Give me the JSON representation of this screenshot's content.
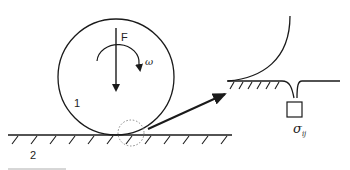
{
  "diagram": {
    "labels": {
      "force": "F",
      "angular_velocity": "ω",
      "body_1": "1",
      "body_2": "2",
      "stress": "σ",
      "stress_subscript": "ij"
    },
    "colors": {
      "stroke": "#1a1a1a",
      "dotted": "#888888",
      "background": "#ffffff"
    },
    "elements": [
      "rolling-circle",
      "ground-surface",
      "force-arrow",
      "rotation-arrow",
      "contact-zone-dotted-circle",
      "magnification-arrow",
      "magnified-contact-detail",
      "stress-element-box"
    ]
  }
}
